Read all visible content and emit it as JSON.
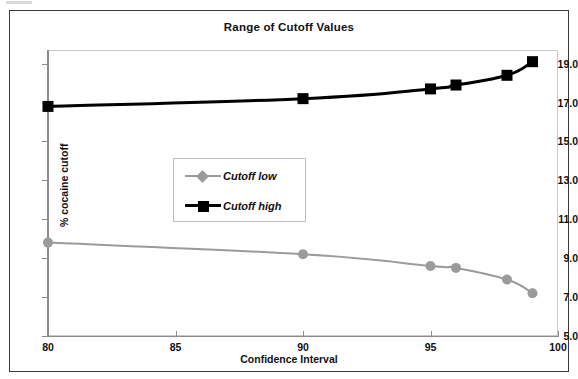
{
  "chart_data": {
    "type": "line",
    "title": "Range of Cutoff Values",
    "xlabel": "Confidence Interval",
    "ylabel": "% cocaine cutoff",
    "x": [
      80,
      90,
      95,
      96,
      98,
      99
    ],
    "xlim": [
      80,
      100
    ],
    "ylim": [
      5.0,
      19.7
    ],
    "xticks": [
      "80",
      "85",
      "90",
      "95",
      "100"
    ],
    "xtick_values": [
      80,
      85,
      90,
      95,
      100
    ],
    "yticks": [
      "5.0",
      "7.0",
      "9.0",
      "11.0",
      "13.0",
      "15.0",
      "17.0",
      "19.0"
    ],
    "ytick_values": [
      5.0,
      7.0,
      9.0,
      11.0,
      13.0,
      15.0,
      17.0,
      19.0
    ],
    "grid": false,
    "legend_position": "center-left",
    "series": [
      {
        "name": "Cutoff low",
        "color": "#9b9b9b",
        "marker": "diamond",
        "values": [
          9.8,
          9.2,
          8.6,
          8.5,
          7.9,
          7.2
        ]
      },
      {
        "name": "Cutoff high",
        "color": "#000000",
        "marker": "square",
        "values": [
          16.8,
          17.2,
          17.7,
          17.9,
          18.4,
          19.1
        ]
      }
    ]
  },
  "legend": {
    "items": [
      {
        "label": "Cutoff low"
      },
      {
        "label": "Cutoff high"
      }
    ]
  }
}
